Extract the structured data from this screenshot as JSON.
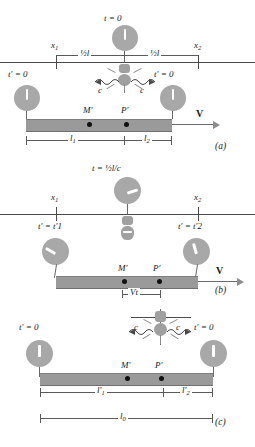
{
  "figure": {
    "accent_bar_color": "#9a9a9a",
    "clock_face_color": "#a8a8a8"
  },
  "panels": [
    {
      "tag": "(a)",
      "time_label": "t = 0",
      "axis_marks": {
        "left": "x",
        "left_sub": "1",
        "right": "x",
        "right_sub": "2"
      },
      "half_length_left": "½l",
      "half_length_right": "½l",
      "clock_left_label": "t′ = 0",
      "clock_right_label": "t′ = 0",
      "speed_left": "c",
      "speed_right": "c",
      "bar_points": [
        "M′",
        "P′"
      ],
      "velocity_label": "V",
      "dim_left": "l",
      "dim_left_sub": "1",
      "dim_right": "l",
      "dim_right_sub": "2"
    },
    {
      "tag": "(b)",
      "time_label": "t = ½l/c",
      "axis_marks": {
        "left": "x",
        "left_sub": "1",
        "right": "x",
        "right_sub": "2"
      },
      "clock_left_label": "t′ = t′1",
      "clock_right_label": "t′ = t′2",
      "bar_points": [
        "M′",
        "P′"
      ],
      "velocity_label": "V",
      "dim_center": "Vt"
    },
    {
      "tag": "(c)",
      "clock_left_label": "t′ = 0",
      "clock_right_label": "t′ = 0",
      "speed_left": "c",
      "speed_right": "c",
      "bar_points": [
        "M′",
        "P′"
      ],
      "dim_left": "l′",
      "dim_left_sub": "1",
      "dim_right": "l′",
      "dim_right_sub": "2",
      "dim_total": "l",
      "dim_total_sub": "0"
    }
  ]
}
